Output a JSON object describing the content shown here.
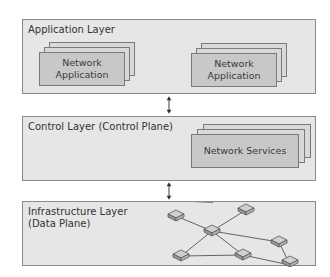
{
  "diagram": {
    "layers": [
      {
        "id": "application",
        "title": "Application Layer"
      },
      {
        "id": "control",
        "title": "Control Layer (Control Plane)"
      },
      {
        "id": "infrastructure",
        "title": "Infrastructure Layer\n(Data Plane)"
      }
    ],
    "application_cards": [
      {
        "label": "Network\nApplication"
      },
      {
        "label": "Network\nApplication"
      }
    ],
    "control_cards": [
      {
        "label": "Network Services"
      }
    ],
    "arrows": [
      {
        "from": "application",
        "to": "control",
        "direction": "bidirectional"
      },
      {
        "from": "control",
        "to": "infrastructure",
        "direction": "bidirectional"
      }
    ],
    "network": {
      "switches": 7,
      "link_count": 8
    }
  }
}
